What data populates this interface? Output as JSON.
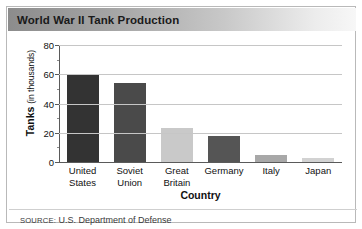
{
  "figure": {
    "title": "World War II Tank Production",
    "source_prefix": "SOURCE:",
    "source_text": " U.S. Department of Defense"
  },
  "axis": {
    "y_label_main": "Tanks",
    "y_label_units": "(in thousands)",
    "x_label": "Country",
    "y_ticks": [
      "80",
      "60",
      "40",
      "20",
      "0"
    ]
  },
  "colors": {
    "bar_united_states": "#333333",
    "bar_soviet_union": "#4a4a4a",
    "bar_great_britain": "#c9c9c9",
    "bar_germany": "#555555",
    "bar_italy": "#a8a8a8",
    "bar_japan": "#d2d2d2",
    "gridline": "#c6c6c6",
    "axis": "#5a5a5a",
    "title_text": "#1a1a1a",
    "frame_border": "#b9b9b9"
  },
  "chart_data": {
    "type": "bar",
    "title": "World War II Tank Production",
    "xlabel": "Country",
    "ylabel": "Tanks (in thousands)",
    "ylim": [
      0,
      80
    ],
    "yticks": [
      0,
      20,
      40,
      60,
      80
    ],
    "grid": true,
    "legend": "none",
    "categories": [
      "United States",
      "Soviet Union",
      "Great Britain",
      "Germany",
      "Italy",
      "Japan"
    ],
    "category_lines": [
      [
        "United",
        "States"
      ],
      [
        "Soviet",
        "Union"
      ],
      [
        "Great",
        "Britain"
      ],
      [
        "Germany",
        ""
      ],
      [
        "Italy",
        ""
      ],
      [
        "Japan",
        ""
      ]
    ],
    "values": [
      60,
      54,
      23,
      18,
      5,
      2.5
    ],
    "bar_colors": [
      "#333333",
      "#4a4a4a",
      "#c9c9c9",
      "#555555",
      "#a8a8a8",
      "#d2d2d2"
    ],
    "source": "SOURCE: U.S. Department of Defense"
  }
}
